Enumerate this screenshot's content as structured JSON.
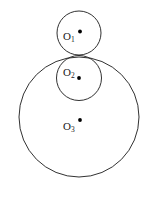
{
  "figure": {
    "canvas": {
      "width": 152,
      "height": 201,
      "background": "#ffffff"
    },
    "stroke_color": "#1a1a1a",
    "dot_color": "#000000",
    "tangency_point": {
      "x": 79,
      "y": 55
    },
    "circles": [
      {
        "id": "circle-1",
        "label": "O",
        "subscript": "1",
        "cx": 79,
        "cy": 33,
        "r": 22,
        "dot_x": 80,
        "dot_y": 31.5
      },
      {
        "id": "circle-2",
        "label": "O",
        "subscript": "2",
        "cx": 79,
        "cy": 78,
        "r": 22.5,
        "dot_x": 79,
        "dot_y": 78
      },
      {
        "id": "circle-3",
        "label": "O",
        "subscript": "3",
        "cx": 79,
        "cy": 117,
        "r": 60,
        "dot_x": 80,
        "dot_y": 120
      }
    ]
  }
}
